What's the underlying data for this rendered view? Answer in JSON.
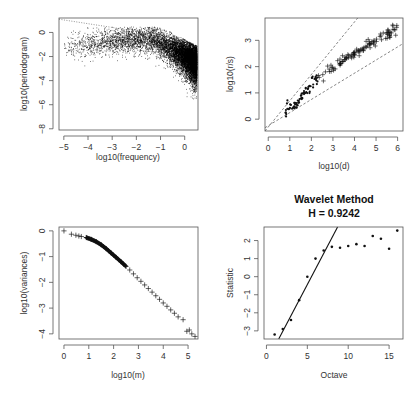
{
  "chart_data": [
    {
      "id": "periodogram",
      "type": "scatter",
      "title": "",
      "xlabel": "log10(frequency)",
      "ylabel": "log10(periodogram)",
      "xlim": [
        -5.2,
        0.55
      ],
      "ylim": [
        -8.1,
        1.2
      ],
      "xticks": [
        -5,
        -4,
        -3,
        -2,
        -1,
        0
      ],
      "yticks": [
        0,
        -2,
        -4,
        -6,
        -8
      ],
      "box": {
        "left": 59,
        "top": 18,
        "right": 198,
        "bottom": 130
      },
      "grid": false,
      "reference_line": {
        "style": "dotted",
        "from": [
          -5.2,
          1.1
        ],
        "to": [
          -2.3,
          0.2
        ]
      },
      "cloud_description": "dense point cloud; upper envelope ~0.4 for log10(freq) in [-3,-1], falling to ~-0.8 near 0; lower tail reaches ~-7.5 near 0",
      "cloud_params": {
        "n": 9000,
        "seed": 7
      }
    },
    {
      "id": "rs",
      "type": "scatter",
      "title": "",
      "xlabel": "log10(d)",
      "ylabel": "log10(r/s)",
      "xlim": [
        -0.15,
        6.25
      ],
      "ylim": [
        -0.45,
        3.85
      ],
      "xticks": [
        0,
        1,
        2,
        3,
        4,
        5,
        6
      ],
      "yticks": [
        0,
        1,
        2,
        3
      ],
      "box": {
        "left": 265,
        "top": 18,
        "right": 403,
        "bottom": 131
      },
      "grid": false,
      "reference_lines": [
        {
          "style": "dashed",
          "slope": 1.0,
          "intercept": -0.3
        },
        {
          "style": "dashed",
          "slope": 0.5,
          "intercept": -0.25
        }
      ],
      "series": [
        {
          "name": "dots",
          "marker": "dot",
          "x_range": [
            0.75,
            2.3
          ],
          "trend": {
            "slope": 0.95,
            "intercept": -0.55
          }
        },
        {
          "name": "crosses",
          "marker": "cross",
          "x_range": [
            2.2,
            6.0
          ],
          "trend": {
            "slope": 0.72,
            "intercept": 0.0
          }
        }
      ]
    },
    {
      "id": "variances",
      "type": "scatter",
      "title": "",
      "xlabel": "log10(m)",
      "ylabel": "log10(variances)",
      "xlim": [
        -0.2,
        5.4
      ],
      "ylim": [
        -4.2,
        0.15
      ],
      "xticks": [
        0,
        1,
        2,
        3,
        4,
        5
      ],
      "yticks": [
        0,
        -1,
        -2,
        -3,
        -4
      ],
      "box": {
        "left": 59,
        "top": 227,
        "right": 198,
        "bottom": 339
      },
      "grid": false,
      "marker": "cross",
      "points": [
        [
          0.0,
          0.0
        ],
        [
          0.3,
          -0.13
        ],
        [
          0.48,
          -0.17
        ],
        [
          0.6,
          -0.2
        ],
        [
          0.7,
          -0.22
        ],
        [
          0.9,
          -0.26
        ],
        [
          1.1,
          -0.33
        ],
        [
          1.3,
          -0.42
        ],
        [
          1.5,
          -0.54
        ],
        [
          1.7,
          -0.69
        ],
        [
          1.9,
          -0.86
        ],
        [
          2.1,
          -1.03
        ],
        [
          2.3,
          -1.2
        ],
        [
          2.5,
          -1.38
        ],
        [
          2.65,
          -1.52
        ],
        [
          2.8,
          -1.67
        ],
        [
          2.95,
          -1.82
        ],
        [
          3.1,
          -1.96
        ],
        [
          3.25,
          -2.1
        ],
        [
          3.4,
          -2.24
        ],
        [
          3.55,
          -2.38
        ],
        [
          3.7,
          -2.52
        ],
        [
          3.85,
          -2.66
        ],
        [
          4.0,
          -2.8
        ],
        [
          4.15,
          -2.93
        ],
        [
          4.3,
          -3.07
        ],
        [
          4.45,
          -3.2
        ],
        [
          4.6,
          -3.34
        ],
        [
          4.8,
          -3.45
        ],
        [
          4.95,
          -3.9
        ],
        [
          5.05,
          -3.85
        ],
        [
          5.15,
          -4.0
        ],
        [
          5.28,
          -4.1
        ]
      ],
      "dense_segment": {
        "x_range": [
          0.9,
          2.5
        ]
      }
    },
    {
      "id": "wavelet",
      "type": "scatter",
      "title": "Wavelet Method",
      "subtitle": "H = 0.9242",
      "xlabel": "Octave",
      "ylabel": "Statistic",
      "xlim": [
        -0.3,
        16.7
      ],
      "ylim": [
        -3.45,
        2.75
      ],
      "xticks": [
        0,
        5,
        10,
        15
      ],
      "yticks": [
        -3,
        -2,
        -1,
        0,
        1,
        2
      ],
      "box": {
        "left": 264,
        "top": 227,
        "right": 403,
        "bottom": 339
      },
      "grid": false,
      "x": [
        1,
        2,
        3,
        4,
        5,
        6,
        7,
        8,
        9,
        10,
        11,
        12,
        13,
        14,
        15,
        16
      ],
      "values": [
        -3.2,
        -2.9,
        -2.4,
        -1.3,
        0.0,
        1.0,
        1.45,
        1.65,
        1.6,
        1.7,
        1.8,
        1.7,
        2.25,
        2.1,
        1.55,
        2.55
      ],
      "fit_line": {
        "from": [
          1.5,
          -3.45
        ],
        "to": [
          8.7,
          2.75
        ]
      }
    }
  ]
}
